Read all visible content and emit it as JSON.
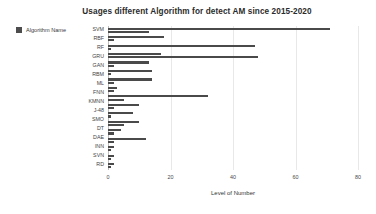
{
  "chart_data": {
    "type": "bar",
    "orientation": "horizontal",
    "title": "Usages different Algorithm for detect AM since 2015-2020",
    "xlabel": "Level of Number",
    "ylabel": "",
    "xlim": [
      0,
      80
    ],
    "xticks": [
      0,
      20,
      40,
      60,
      80
    ],
    "grid": true,
    "legend": {
      "position": "left-outside",
      "entries": [
        {
          "label": "Algorithm Name",
          "color": "#4d4d4d"
        }
      ]
    },
    "bar_color": "#4a4a4a",
    "categories": [
      "SVM",
      "RBF",
      "RF",
      "GRU",
      "GAN",
      "RBM",
      "ML",
      "FNN",
      "KMNN",
      "J-48",
      "SMO",
      "DT",
      "DAE",
      "INN",
      "SVN",
      "RD"
    ],
    "groups": [
      {
        "category": "SVM",
        "values": [
          71,
          13
        ]
      },
      {
        "category": "RBF",
        "values": [
          18,
          2
        ]
      },
      {
        "category": "RF",
        "values": [
          47,
          1
        ]
      },
      {
        "category": "RF2",
        "values": [
          17,
          48
        ]
      },
      {
        "category": "GRU",
        "values": [
          13,
          2
        ]
      },
      {
        "category": "GAN",
        "values": [
          14,
          1
        ]
      },
      {
        "category": "RBM",
        "values": [
          14,
          2
        ]
      },
      {
        "category": "ML",
        "values": [
          3,
          2
        ]
      },
      {
        "category": "FNN",
        "values": [
          32,
          5
        ]
      },
      {
        "category": "KMNN",
        "values": [
          10,
          2
        ]
      },
      {
        "category": "J-48",
        "values": [
          8,
          1
        ]
      },
      {
        "category": "SMO",
        "values": [
          10,
          5
        ]
      },
      {
        "category": "DT",
        "values": [
          4,
          2
        ]
      },
      {
        "category": "DAE",
        "values": [
          12,
          2
        ]
      },
      {
        "category": "INN",
        "values": [
          2,
          1
        ]
      },
      {
        "category": "SVN",
        "values": [
          2,
          1
        ]
      },
      {
        "category": "RD",
        "values": [
          2,
          1
        ]
      }
    ],
    "bars": [
      71,
      13,
      18,
      2,
      47,
      1,
      17,
      48,
      13,
      2,
      14,
      1,
      14,
      2,
      3,
      2,
      32,
      5,
      10,
      2,
      8,
      1,
      10,
      5,
      4,
      2,
      12,
      2,
      2,
      1,
      2,
      1,
      2
    ]
  }
}
